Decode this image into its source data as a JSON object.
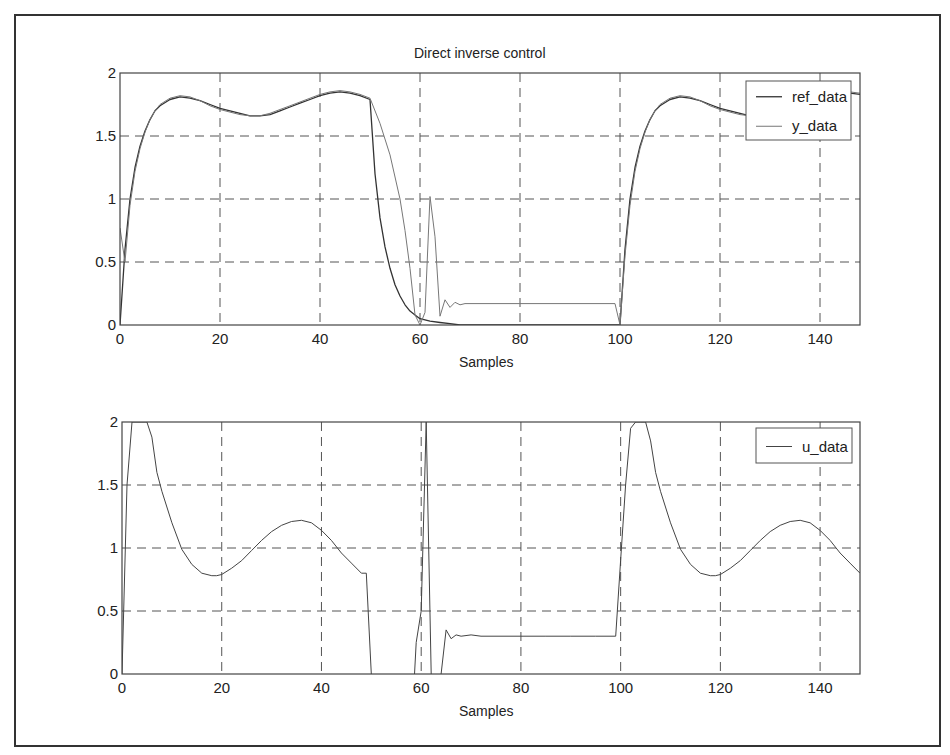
{
  "figure": {
    "title": "Direct inverse control",
    "frame_color": "#333333"
  },
  "chart_data": [
    {
      "type": "line",
      "title": "Direct inverse control",
      "xlabel": "Samples",
      "ylabel": "",
      "xlim": [
        0,
        148
      ],
      "ylim": [
        0,
        2
      ],
      "xticks": [
        0,
        20,
        40,
        60,
        80,
        100,
        120,
        140
      ],
      "yticks": [
        0,
        0.5,
        1,
        1.5,
        2
      ],
      "ytick_labels": [
        "0",
        "0.5",
        "1",
        "1.5",
        "2"
      ],
      "grid": true,
      "legend_position": "upper right",
      "series": [
        {
          "name": "ref_data",
          "color": "#333333",
          "width": 1.3,
          "x": [
            0,
            1,
            2,
            3,
            4,
            5,
            6,
            7,
            8,
            10,
            12,
            14,
            16,
            18,
            20,
            22,
            24,
            26,
            28,
            30,
            32,
            34,
            36,
            38,
            40,
            42,
            44,
            46,
            48,
            50,
            51,
            52,
            53,
            54,
            55,
            56,
            57,
            58,
            59,
            60,
            62,
            64,
            66,
            68,
            70,
            75,
            80,
            85,
            90,
            95,
            99,
            100,
            101,
            102,
            103,
            104,
            105,
            106,
            107,
            108,
            110,
            112,
            114,
            116,
            118,
            120,
            122,
            124,
            126,
            128,
            130,
            132,
            134,
            136,
            138,
            140,
            142,
            144,
            146,
            148
          ],
          "y": [
            0,
            0.6,
            1.0,
            1.25,
            1.42,
            1.54,
            1.63,
            1.7,
            1.74,
            1.79,
            1.81,
            1.8,
            1.78,
            1.75,
            1.72,
            1.7,
            1.68,
            1.66,
            1.66,
            1.67,
            1.7,
            1.73,
            1.76,
            1.79,
            1.82,
            1.84,
            1.85,
            1.84,
            1.82,
            1.79,
            1.2,
            0.85,
            0.62,
            0.45,
            0.32,
            0.23,
            0.16,
            0.11,
            0.08,
            0.05,
            0.03,
            0.02,
            0.01,
            0.0,
            0.0,
            0.0,
            0.0,
            0.0,
            0.0,
            0.0,
            0.0,
            0.0,
            0.6,
            1.0,
            1.25,
            1.42,
            1.54,
            1.63,
            1.7,
            1.74,
            1.79,
            1.81,
            1.8,
            1.78,
            1.75,
            1.72,
            1.7,
            1.68,
            1.66,
            1.66,
            1.67,
            1.7,
            1.73,
            1.76,
            1.79,
            1.82,
            1.84,
            1.85,
            1.84,
            1.83
          ]
        },
        {
          "name": "y_data",
          "color": "#777777",
          "width": 1.0,
          "x": [
            0,
            1,
            2,
            3,
            4,
            5,
            6,
            7,
            8,
            10,
            12,
            14,
            16,
            18,
            20,
            22,
            24,
            26,
            28,
            30,
            32,
            34,
            36,
            38,
            40,
            42,
            44,
            46,
            48,
            50,
            52,
            54,
            56,
            57,
            58,
            59,
            60,
            61,
            62,
            63,
            64,
            65,
            66,
            67,
            68,
            69,
            70,
            72,
            75,
            80,
            85,
            90,
            95,
            99,
            100,
            101,
            102,
            103,
            104,
            105,
            106,
            107,
            108,
            110,
            112,
            114,
            116,
            118,
            120,
            122,
            124,
            126,
            128,
            130,
            132,
            134,
            136,
            138,
            140,
            142,
            144,
            146,
            148
          ],
          "y": [
            0.77,
            0.5,
            0.95,
            1.22,
            1.4,
            1.53,
            1.63,
            1.7,
            1.75,
            1.8,
            1.82,
            1.81,
            1.78,
            1.74,
            1.71,
            1.69,
            1.67,
            1.66,
            1.66,
            1.68,
            1.71,
            1.74,
            1.77,
            1.8,
            1.83,
            1.85,
            1.86,
            1.85,
            1.83,
            1.8,
            1.6,
            1.35,
            1.0,
            0.75,
            0.45,
            0.08,
            0.0,
            0.1,
            1.02,
            0.7,
            0.07,
            0.2,
            0.14,
            0.18,
            0.16,
            0.17,
            0.17,
            0.17,
            0.17,
            0.17,
            0.17,
            0.17,
            0.17,
            0.17,
            0.0,
            0.55,
            0.95,
            1.22,
            1.4,
            1.53,
            1.63,
            1.7,
            1.75,
            1.8,
            1.82,
            1.81,
            1.78,
            1.74,
            1.71,
            1.69,
            1.67,
            1.66,
            1.66,
            1.68,
            1.71,
            1.74,
            1.77,
            1.8,
            1.83,
            1.85,
            1.86,
            1.85,
            1.84
          ]
        }
      ]
    },
    {
      "type": "line",
      "title": "",
      "xlabel": "Samples",
      "ylabel": "",
      "xlim": [
        0,
        148
      ],
      "ylim": [
        0,
        2
      ],
      "xticks": [
        0,
        20,
        40,
        60,
        80,
        100,
        120,
        140
      ],
      "yticks": [
        0,
        0.5,
        1,
        1.5,
        2
      ],
      "ytick_labels": [
        "0",
        "0.5",
        "1",
        "1.5",
        "2"
      ],
      "grid": true,
      "legend_position": "upper right",
      "series": [
        {
          "name": "u_data",
          "color": "#444444",
          "width": 1.0,
          "x": [
            0,
            1,
            2,
            3,
            4,
            5,
            6,
            7,
            8,
            10,
            12,
            14,
            16,
            18,
            19,
            20,
            22,
            24,
            26,
            28,
            30,
            32,
            34,
            36,
            38,
            40,
            42,
            44,
            46,
            48,
            49,
            50,
            50.5,
            58,
            59,
            60,
            61,
            62,
            63,
            64,
            65,
            66,
            67,
            68,
            70,
            72,
            75,
            80,
            85,
            90,
            95,
            99,
            100,
            101,
            102,
            103,
            104,
            105,
            106,
            107,
            108,
            110,
            112,
            114,
            116,
            118,
            119,
            120,
            122,
            124,
            126,
            128,
            130,
            132,
            134,
            136,
            138,
            140,
            142,
            144,
            146,
            148
          ],
          "y": [
            0,
            1.5,
            2.0,
            2.0,
            2.0,
            2.0,
            1.88,
            1.6,
            1.45,
            1.2,
            0.99,
            0.87,
            0.8,
            0.78,
            0.78,
            0.79,
            0.84,
            0.9,
            0.98,
            1.06,
            1.13,
            1.18,
            1.21,
            1.22,
            1.2,
            1.14,
            1.06,
            0.96,
            0.88,
            0.8,
            0.8,
            0.0,
            -0.5,
            -0.5,
            0.25,
            0.5,
            2.0,
            0.0,
            -0.3,
            0.0,
            0.35,
            0.28,
            0.31,
            0.3,
            0.31,
            0.3,
            0.3,
            0.3,
            0.3,
            0.3,
            0.3,
            0.3,
            0.9,
            1.5,
            1.95,
            2.0,
            2.0,
            2.0,
            1.85,
            1.6,
            1.45,
            1.2,
            0.99,
            0.87,
            0.8,
            0.78,
            0.78,
            0.79,
            0.84,
            0.9,
            0.98,
            1.06,
            1.13,
            1.18,
            1.21,
            1.22,
            1.2,
            1.14,
            1.06,
            0.96,
            0.88,
            0.8
          ]
        }
      ]
    }
  ],
  "legends": [
    {
      "items": [
        {
          "label": "ref_data"
        },
        {
          "label": "y_data"
        }
      ]
    },
    {
      "items": [
        {
          "label": "u_data"
        }
      ]
    }
  ],
  "axes_boxes": [
    {
      "left": 120,
      "right": 860,
      "top": 73,
      "bottom": 325,
      "legend": {
        "x": 746,
        "y": 81,
        "w": 105,
        "h": 59
      }
    },
    {
      "left": 122,
      "right": 860,
      "top": 422,
      "bottom": 674,
      "legend": {
        "x": 756,
        "y": 428,
        "w": 96,
        "h": 35
      }
    }
  ]
}
